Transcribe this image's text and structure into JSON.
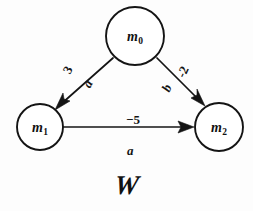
{
  "figure": {
    "caption": "W",
    "background_color": "#fdfdfd",
    "ink_color": "#141414"
  },
  "nodes": [
    {
      "id": "m0",
      "base": "m",
      "sub": "0",
      "cx": 135,
      "cy": 36,
      "r": 29
    },
    {
      "id": "m1",
      "base": "m",
      "sub": "1",
      "cx": 40,
      "cy": 127,
      "r": 23
    },
    {
      "id": "m2",
      "base": "m",
      "sub": "2",
      "cx": 219,
      "cy": 127,
      "r": 24
    }
  ],
  "edges": [
    {
      "id": "edge-m0-m1",
      "from": "m0",
      "to": "m1",
      "weight": "3",
      "symbol": "a",
      "weight_pos": {
        "x": 68,
        "y": 70,
        "rotate": -62
      },
      "symbol_pos": {
        "x": 88,
        "y": 84,
        "rotate": -62
      }
    },
    {
      "id": "edge-m0-m2",
      "from": "m0",
      "to": "m2",
      "weight": "-2",
      "symbol": "b",
      "weight_pos": {
        "x": 183,
        "y": 72,
        "rotate": -65
      },
      "symbol_pos": {
        "x": 167,
        "y": 88,
        "rotate": -65
      }
    },
    {
      "id": "edge-m1-m2",
      "from": "m1",
      "to": "m2",
      "weight": "−5",
      "symbol": "a",
      "weight_pos": {
        "x": 126,
        "y": 112,
        "rotate": 0
      },
      "symbol_pos": {
        "x": 127,
        "y": 143,
        "rotate": 0
      }
    }
  ],
  "caption_pos": {
    "x": 127,
    "y": 185
  }
}
